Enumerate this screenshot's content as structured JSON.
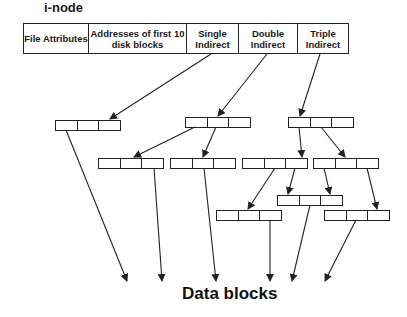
{
  "title": "i-node",
  "inode": {
    "cells": [
      {
        "label": "File Attributes",
        "width": 65
      },
      {
        "label": "Addresses of first 10 disk blocks",
        "width": 98
      },
      {
        "label": "Single Indirect",
        "width": 52
      },
      {
        "label": "Double Indirect",
        "width": 59
      },
      {
        "label": "Triple Indirect",
        "width": 50
      }
    ]
  },
  "blocks": [
    {
      "id": "A",
      "x": 55,
      "y": 120,
      "level": "single-1"
    },
    {
      "id": "B",
      "x": 185,
      "y": 117,
      "level": "double-1"
    },
    {
      "id": "C",
      "x": 288,
      "y": 117,
      "level": "triple-1"
    },
    {
      "id": "D",
      "x": 98,
      "y": 158,
      "level": "double-2"
    },
    {
      "id": "E",
      "x": 170,
      "y": 158,
      "level": "double-2"
    },
    {
      "id": "F",
      "x": 242,
      "y": 158,
      "level": "triple-2"
    },
    {
      "id": "G",
      "x": 313,
      "y": 158,
      "level": "triple-2"
    },
    {
      "id": "H",
      "x": 216,
      "y": 210,
      "level": "triple-3"
    },
    {
      "id": "I",
      "x": 277,
      "y": 195,
      "level": "triple-3"
    },
    {
      "id": "J",
      "x": 324,
      "y": 210,
      "level": "triple-3"
    }
  ],
  "block_size": {
    "w": 65,
    "h": 10
  },
  "arrows": [
    {
      "from": [
        211,
        54
      ],
      "to": [
        110,
        119
      ]
    },
    {
      "from": [
        267,
        54
      ],
      "to": [
        218,
        116
      ]
    },
    {
      "from": [
        320,
        54
      ],
      "to": [
        300,
        116
      ]
    },
    {
      "from": [
        195,
        127
      ],
      "to": [
        134,
        157
      ]
    },
    {
      "from": [
        216,
        127
      ],
      "to": [
        203,
        157
      ]
    },
    {
      "from": [
        299,
        127
      ],
      "to": [
        302,
        157
      ]
    },
    {
      "from": [
        321,
        127
      ],
      "to": [
        345,
        157
      ]
    },
    {
      "from": [
        275,
        168
      ],
      "to": [
        248,
        209
      ]
    },
    {
      "from": [
        295,
        168
      ],
      "to": [
        288,
        194
      ]
    },
    {
      "from": [
        324,
        168
      ],
      "to": [
        330,
        194
      ]
    },
    {
      "from": [
        367,
        168
      ],
      "to": [
        377,
        209
      ]
    },
    {
      "from": [
        66,
        130
      ],
      "to": [
        127,
        281
      ]
    },
    {
      "from": [
        154,
        168
      ],
      "to": [
        162,
        281
      ]
    },
    {
      "from": [
        204,
        168
      ],
      "to": [
        216,
        281
      ]
    },
    {
      "from": [
        270,
        220
      ],
      "to": [
        270,
        281
      ]
    },
    {
      "from": [
        310,
        205
      ],
      "to": [
        292,
        281
      ]
    },
    {
      "from": [
        356,
        220
      ],
      "to": [
        325,
        281
      ]
    }
  ],
  "data_label": "Data blocks"
}
